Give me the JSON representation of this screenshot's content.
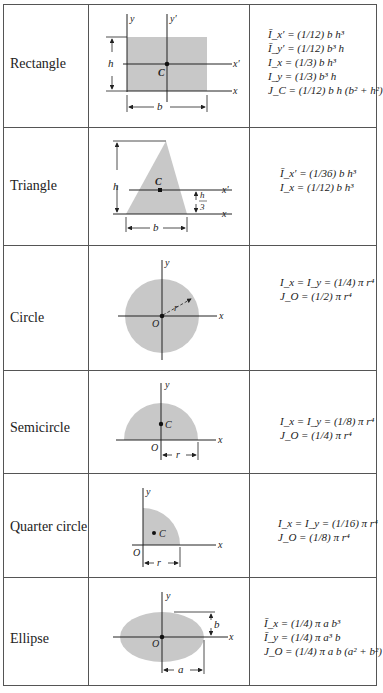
{
  "table": {
    "title": "Moments of inertia of common areas",
    "colors": {
      "fill": "#c8c8c8",
      "line": "#222222",
      "border": "#555555"
    },
    "rows": [
      {
        "shape": "Rectangle",
        "labels": {
          "y": "y",
          "yprime": "y′",
          "xprime": "x′",
          "x": "x",
          "h": "h",
          "b": "b",
          "C": "C"
        },
        "formulas": [
          "Ī_x′ = (1/12) b h³",
          "Ī_y′ = (1/12) b³ h",
          "I_x = (1/3) b h³",
          "I_y = (1/3) b³ h",
          "J_C = (1/12) b h (b² + h²)"
        ]
      },
      {
        "shape": "Triangle",
        "labels": {
          "h": "h",
          "C": "C",
          "xprime": "x′",
          "x": "x",
          "h3_num": "h",
          "h3_den": "3",
          "b": "b"
        },
        "formulas": [
          "Ī_x′ = (1/36) b h³",
          "I_x = (1/12) b h³"
        ]
      },
      {
        "shape": "Circle",
        "labels": {
          "y": "y",
          "x": "x",
          "r": "r",
          "O": "O"
        },
        "formulas": [
          "I_x = I_y = (1/4) π r⁴",
          "J_O = (1/2) π r⁴"
        ]
      },
      {
        "shape": "Semicircle",
        "labels": {
          "y": "y",
          "x": "x",
          "C": "C",
          "O": "O",
          "r": "r"
        },
        "formulas": [
          "I_x = I_y = (1/8) π r⁴",
          "J_O = (1/4) π r⁴"
        ]
      },
      {
        "shape": "Quarter circle",
        "labels": {
          "y": "y",
          "x": "x",
          "C": "C",
          "O": "O",
          "r": "r"
        },
        "formulas": [
          "I_x = I_y = (1/16) π r⁴",
          "J_O = (1/8) π r⁴"
        ]
      },
      {
        "shape": "Ellipse",
        "labels": {
          "y": "y",
          "x": "x",
          "b": "b",
          "O": "O",
          "a": "a"
        },
        "formulas": [
          "Ī_x = (1/4) π a b³",
          "Ī_y = (1/4) π a³ b",
          "J_O = (1/4) π a b (a² + b²)"
        ]
      }
    ]
  },
  "formatted": {
    "rect": [
      "Ī",
      "x′",
      " = ",
      "1",
      "12",
      "bh³",
      "Ī",
      "y′",
      " = ",
      "1",
      "12",
      " b³h",
      "I",
      "x",
      " = ",
      "1",
      "3",
      "bh³",
      "I",
      "y",
      " = ",
      "1",
      "3",
      "b³h",
      "J",
      "C",
      " = ",
      "1",
      "12",
      "bh(b² + h²)"
    ]
  }
}
